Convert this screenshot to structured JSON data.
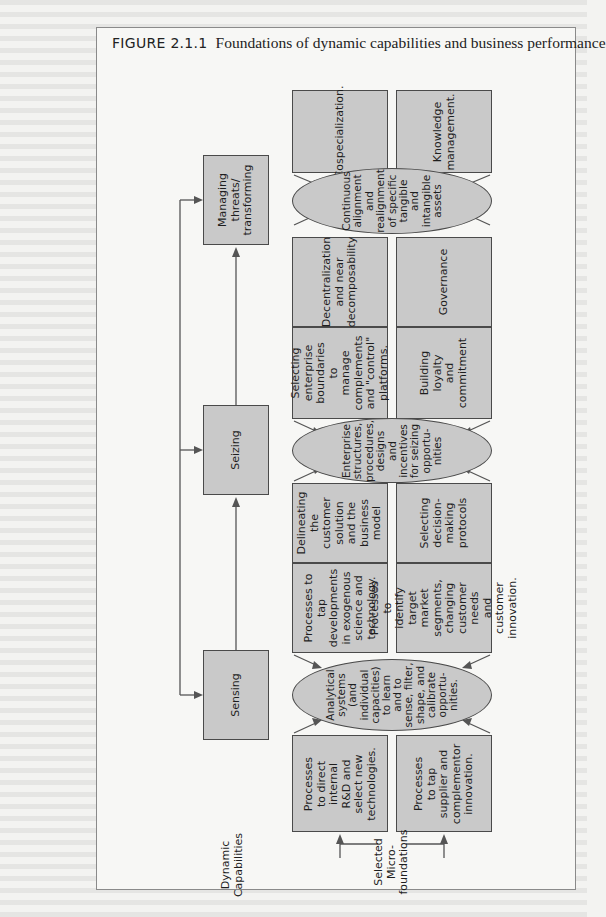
{
  "figure": {
    "number": "FIGURE 2.1.1",
    "title": "Foundations of dynamic capabilities and business performance"
  },
  "labels": {
    "dynamic_capabilities": "Dynamic\nCapabilities",
    "selected_microfoundations": "Selected\nMicro-\nfoundations"
  },
  "capabilities": [
    {
      "id": "managing",
      "label": "Managing\nthreats/\ntransforming"
    },
    {
      "id": "seizing",
      "label": "Seizing"
    },
    {
      "id": "sensing",
      "label": "Sensing"
    }
  ],
  "ellipses": {
    "managing": "Continuous\nalignment\nand\nrealignment\nof specific\ntangible\nand\nintangible\nassets",
    "seizing": "Enterprise\nstructures,\nprocedures,\ndesigns\nand\nincentives\nfor seizing\nopportu-\nnities",
    "sensing": "Analytical\nsystems\n(and\nindividual\ncapacities)\nto learn\nand to\nsense, filter,\nshape, and\ncalibrate\nopportu-\nnities."
  },
  "microfoundations": {
    "managing": {
      "top_a": "Cospecialization.",
      "top_b": "Knowledge\nmanagement.",
      "bottom_a": "Decentralization\nand near\ndecomposability",
      "bottom_b": "Governance"
    },
    "seizing": {
      "top_a": "Selecting\nenterprise\nboundaries to\nmanage\ncomplements\nand \"control\"\nplatforms.",
      "top_b": "Building\nloyalty\nand\ncommitment",
      "bottom_a": "Delineating\nthe customer\nsolution\nand the\nbusiness\nmodel",
      "bottom_b": "Selecting\ndecision-\nmaking\nprotocols"
    },
    "sensing": {
      "top_a": "Processes to tap\ndevelopments\nin exogenous\nscience and\ntechnology.",
      "top_b": "Processes to\nidentify target\nmarket segments,\nchanging\ncustomer needs\nand customer\ninnovation.",
      "bottom_a": "Processes\nto direct\ninternal\nR&D and\nselect new\ntechnologies.",
      "bottom_b": "Processes\nto tap\nsupplier and\ncomplementor\ninnovation."
    }
  },
  "colors": {
    "box_fill": "#c9c9c9",
    "border": "#4a4a4a",
    "page": "#f7f7f5"
  }
}
